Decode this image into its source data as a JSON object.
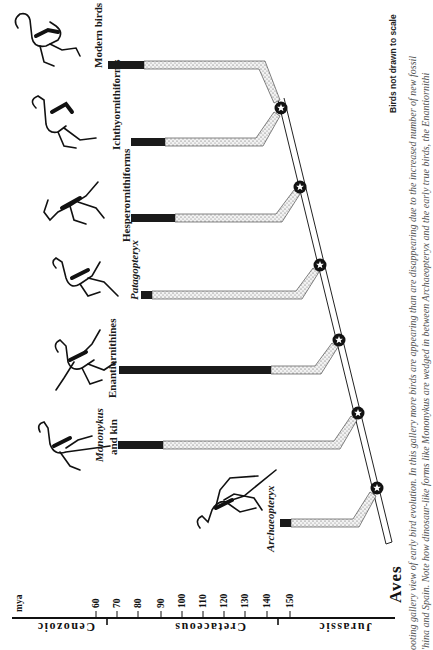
{
  "figure": {
    "root_label": "Aves",
    "note": "Birds not drawn to scale",
    "caption": [
      "ooting gallery view of early bird evolution. In this gallery more birds are appearing than are disappearing due to the increased number of new fossil",
      "'hina and Spain. Note how dinosaur-like forms like Mononykus are wedged in between Archaeopteryx and the early true birds, the Enantiornithi"
    ]
  },
  "axis": {
    "unit_label": "mya",
    "ticks": [
      "60",
      "70",
      "80",
      "90",
      "100",
      "110",
      "120",
      "130",
      "140",
      "150"
    ],
    "periods": [
      "Cenozoic",
      "Cretaceous",
      "Jurassic"
    ]
  },
  "lineages": [
    {
      "name": "Modern birds",
      "italic": false,
      "fossil_start_mya": 65,
      "ghost_end_mya": 140
    },
    {
      "name": "Ichthyornithiforms",
      "italic": false,
      "fossil_start_mya": 75,
      "ghost_end_mya": 139
    },
    {
      "name": "Hesperornithiforms",
      "italic": false,
      "fossil_start_mya": 75,
      "ghost_end_mya": 143
    },
    {
      "name": "Patagopteryx",
      "italic": true,
      "fossil_start_mya": 80,
      "ghost_end_mya": 145
    },
    {
      "name": "Enantiornithines",
      "italic": false,
      "fossil_start_mya": 70,
      "ghost_end_mya": 146
    },
    {
      "name": "Mononykus",
      "name_line2": "and kin",
      "italic": true,
      "fossil_start_mya": 70,
      "ghost_end_mya": 148
    },
    {
      "name": "Archaeopteryx",
      "italic": true,
      "fossil_start_mya": 145,
      "ghost_end_mya": 150
    }
  ],
  "legend_colors": {
    "fossil_record": "#1a1a1a",
    "ghost_lineage": "#e6e6e6",
    "aves_stem": "#ffffff",
    "node_marker": "#111111"
  }
}
